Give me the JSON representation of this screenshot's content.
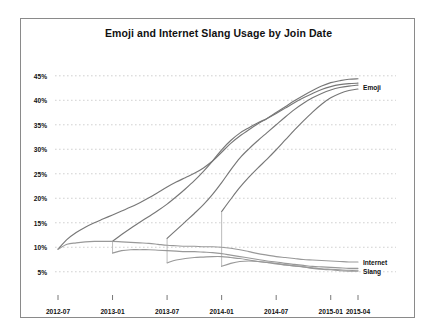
{
  "chart_data": {
    "type": "line",
    "title": "Emoji and Internet Slang Usage by Join Date",
    "xlabel": "",
    "ylabel": "",
    "grid": true,
    "legend_position": "right-inline",
    "ylim": [
      2.5,
      47
    ],
    "ytick_labels": [
      "5%",
      "10%",
      "15%",
      "20%",
      "25%",
      "30%",
      "35%",
      "40%",
      "45%"
    ],
    "ytick_values": [
      5,
      10,
      15,
      20,
      25,
      30,
      35,
      40,
      45
    ],
    "xtick_labels": [
      "2012-07",
      "2013-01",
      "2013-07",
      "2014-01",
      "2014-07",
      "2015-01",
      "2015-04"
    ],
    "xtick_values": [
      0,
      6,
      12,
      18,
      24,
      30,
      33
    ],
    "xlim": [
      0,
      33
    ],
    "annotations": [
      {
        "text": "Emoji",
        "x": 33,
        "y": 42.8
      },
      {
        "text": "Internet",
        "x": 33,
        "y": 7.0
      },
      {
        "text": "Slang",
        "x": 33,
        "y": 5.2
      }
    ],
    "series": [
      {
        "name": "Emoji cohort 2012-07",
        "group": "Emoji",
        "color": "#777777",
        "x": [
          0,
          1,
          2,
          3,
          4,
          5,
          6,
          7,
          8,
          9,
          10,
          11,
          12,
          13,
          14,
          15,
          16,
          17,
          18,
          19,
          20,
          21,
          22,
          23,
          24,
          25,
          26,
          27,
          28,
          29,
          30,
          31,
          32,
          33
        ],
        "values": [
          9.6,
          11.6,
          13.0,
          14.1,
          15.0,
          15.8,
          16.6,
          17.4,
          18.2,
          19.1,
          20.1,
          21.2,
          22.3,
          23.3,
          24.2,
          25.1,
          26.2,
          27.6,
          29.4,
          31.2,
          32.7,
          34.0,
          35.2,
          36.3,
          37.5,
          38.7,
          39.9,
          41.0,
          42.0,
          42.9,
          43.6,
          44.0,
          44.3,
          44.4
        ]
      },
      {
        "name": "Emoji cohort 2013-01",
        "group": "Emoji",
        "color": "#777777",
        "x": [
          6,
          7,
          8,
          9,
          10,
          11,
          12,
          13,
          14,
          15,
          16,
          17,
          18,
          19,
          20,
          21,
          22,
          23,
          24,
          25,
          26,
          27,
          28,
          29,
          30,
          31,
          32,
          33
        ],
        "values": [
          11.2,
          12.6,
          13.9,
          15.1,
          16.3,
          17.5,
          18.8,
          20.3,
          21.9,
          23.6,
          25.5,
          27.6,
          29.9,
          31.8,
          33.3,
          34.4,
          35.4,
          36.3,
          37.3,
          38.4,
          39.5,
          40.5,
          41.4,
          42.2,
          42.8,
          43.2,
          43.4,
          43.5
        ]
      },
      {
        "name": "Emoji cohort 2013-07",
        "group": "Emoji",
        "color": "#777777",
        "x": [
          12,
          13,
          14,
          15,
          16,
          17,
          18,
          19,
          20,
          21,
          22,
          23,
          24,
          25,
          26,
          27,
          28,
          29,
          30,
          31,
          32,
          33
        ],
        "values": [
          11.8,
          13.5,
          15.2,
          16.9,
          18.7,
          20.8,
          23.2,
          25.8,
          28.2,
          30.1,
          31.8,
          33.4,
          35.0,
          36.6,
          38.1,
          39.4,
          40.5,
          41.4,
          42.1,
          42.6,
          42.9,
          43.1
        ]
      },
      {
        "name": "Emoji cohort 2014-01",
        "group": "Emoji",
        "color": "#777777",
        "x": [
          18,
          19,
          20,
          21,
          22,
          23,
          24,
          25,
          26,
          27,
          28,
          29,
          30,
          31,
          32,
          33
        ],
        "values": [
          17.3,
          19.8,
          22.2,
          24.3,
          26.2,
          28.0,
          29.9,
          31.9,
          33.9,
          35.8,
          37.6,
          39.2,
          40.5,
          41.4,
          42.0,
          42.3
        ]
      },
      {
        "name": "Slang cohort 2012-07",
        "group": "Internet Slang",
        "color": "#999999",
        "x": [
          0,
          1,
          2,
          3,
          4,
          5,
          6,
          7,
          8,
          9,
          10,
          11,
          12,
          13,
          14,
          15,
          16,
          17,
          18,
          19,
          20,
          21,
          22,
          23,
          24,
          25,
          26,
          27,
          28,
          29,
          30,
          31,
          32,
          33
        ],
        "values": [
          9.6,
          10.6,
          10.9,
          11.1,
          11.2,
          11.2,
          11.2,
          11.1,
          11.0,
          10.9,
          10.8,
          10.6,
          10.4,
          10.3,
          10.2,
          10.2,
          10.1,
          10.1,
          10.0,
          9.8,
          9.5,
          9.1,
          8.7,
          8.4,
          8.1,
          7.9,
          7.7,
          7.5,
          7.4,
          7.3,
          7.2,
          7.1,
          7.0,
          7.0
        ]
      },
      {
        "name": "Slang cohort 2013-01",
        "group": "Internet Slang",
        "color": "#999999",
        "x": [
          6,
          7,
          8,
          9,
          10,
          11,
          12,
          13,
          14,
          15,
          16,
          17,
          18,
          19,
          20,
          21,
          22,
          23,
          24,
          25,
          26,
          27,
          28,
          29,
          30,
          31,
          32,
          33
        ],
        "values": [
          8.8,
          9.3,
          9.5,
          9.5,
          9.5,
          9.4,
          9.3,
          9.2,
          9.1,
          9.1,
          9.0,
          8.9,
          8.7,
          8.4,
          8.1,
          7.8,
          7.5,
          7.2,
          7.0,
          6.7,
          6.5,
          6.3,
          6.1,
          6.0,
          5.9,
          5.8,
          5.7,
          5.7
        ]
      },
      {
        "name": "Slang cohort 2013-07",
        "group": "Internet Slang",
        "color": "#999999",
        "x": [
          12,
          13,
          14,
          15,
          16,
          17,
          18,
          19,
          20,
          21,
          22,
          23,
          24,
          25,
          26,
          27,
          28,
          29,
          30,
          31,
          32,
          33
        ],
        "values": [
          6.8,
          7.4,
          7.7,
          7.9,
          8.0,
          8.1,
          8.1,
          7.9,
          7.7,
          7.4,
          7.1,
          6.9,
          6.6,
          6.4,
          6.2,
          6.0,
          5.8,
          5.6,
          5.5,
          5.4,
          5.3,
          5.3
        ]
      },
      {
        "name": "Slang cohort 2014-01",
        "group": "Internet Slang",
        "color": "#999999",
        "x": [
          18,
          19,
          20,
          21,
          22,
          23,
          24,
          25,
          26,
          27,
          28,
          29,
          30,
          31,
          32,
          33
        ],
        "values": [
          6.1,
          6.7,
          7.1,
          7.2,
          7.1,
          6.9,
          6.7,
          6.4,
          6.2,
          6.0,
          5.7,
          5.5,
          5.4,
          5.2,
          5.1,
          5.1
        ]
      }
    ],
    "cohort_drops": [
      {
        "x": 6,
        "from": 11.2,
        "to": 8.8
      },
      {
        "x": 12,
        "from": 11.8,
        "to": 6.8
      },
      {
        "x": 18,
        "from": 17.3,
        "to": 6.1
      }
    ]
  }
}
